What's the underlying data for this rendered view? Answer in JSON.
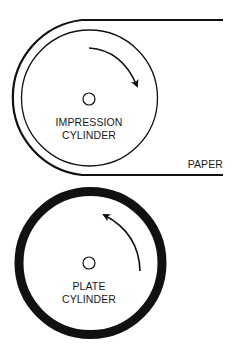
{
  "diagram": {
    "type": "printing-press-schematic",
    "colors": {
      "stroke": "#111111",
      "background": "#ffffff",
      "text": "#1a1a1a"
    },
    "impression_cylinder": {
      "label_line1": "IMPRESSION",
      "label_line2": "CYLINDER",
      "rotation": "clockwise"
    },
    "plate_cylinder": {
      "label_line1": "PLATE",
      "label_line2": "CYLINDER",
      "rotation": "counter-clockwise"
    },
    "paper": {
      "label": "PAPER"
    }
  }
}
